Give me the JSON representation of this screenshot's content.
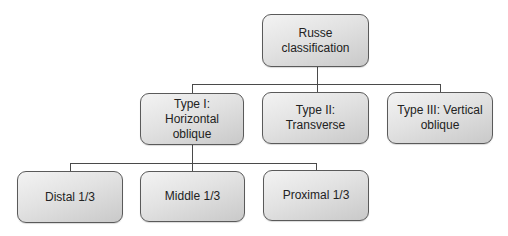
{
  "diagram": {
    "type": "tree",
    "root": {
      "label": "Russe classification"
    },
    "level1": [
      {
        "label": "Type I: Horizontal oblique",
        "has_children": true
      },
      {
        "label": "Type II: Transverse",
        "has_children": false
      },
      {
        "label": "Type III: Vertical oblique",
        "has_children": false
      }
    ],
    "level2": [
      {
        "label": "Distal 1/3",
        "parent": "Type I: Horizontal oblique"
      },
      {
        "label": "Middle 1/3",
        "parent": "Type I: Horizontal oblique"
      },
      {
        "label": "Proximal 1/3",
        "parent": "Type I: Horizontal oblique"
      }
    ],
    "colors": {
      "node_fill_light": "#f3f3f3",
      "node_fill_dark": "#c9c9c9",
      "node_border": "#5a5a5a",
      "connector": "#4a4a4a",
      "text": "#222222"
    }
  }
}
